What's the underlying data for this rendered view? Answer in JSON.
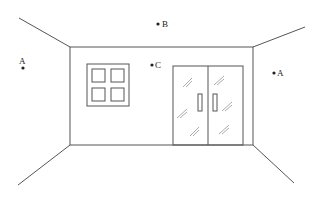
{
  "diagram": {
    "title": "",
    "colors": {
      "line": "#555555",
      "text": "#222222",
      "background": "#ffffff"
    },
    "points": [
      {
        "id": "A_left",
        "label": "A",
        "x": 22,
        "y": 68
      },
      {
        "id": "B",
        "label": "B",
        "x": 157,
        "y": 24
      },
      {
        "id": "C",
        "label": "C",
        "x": 151,
        "y": 66
      },
      {
        "id": "A_right",
        "label": "A",
        "x": 273,
        "y": 74
      }
    ],
    "elements": {
      "back_wall": "back-wall",
      "window": "window with 4 panes",
      "door": "double glass door with handles"
    }
  }
}
